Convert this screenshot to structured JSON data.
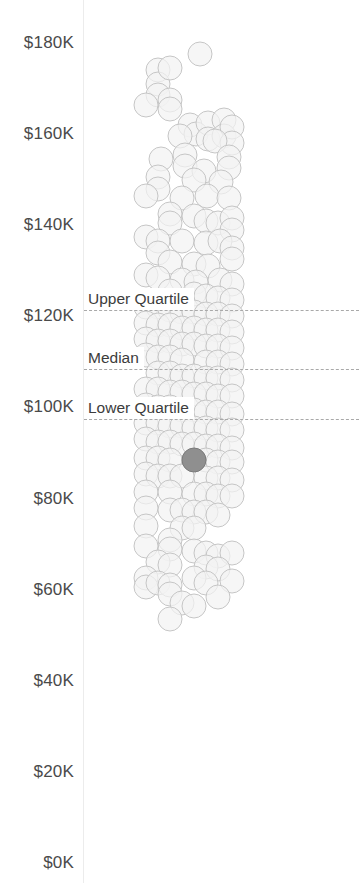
{
  "chart_data": {
    "type": "scatter",
    "title": "",
    "subtitle": "",
    "xlabel": "",
    "ylabel": "",
    "ylim": [
      0,
      190
    ],
    "grid": false,
    "legend_position": "none",
    "value_prefix": "$",
    "value_suffix": "K",
    "y_ticks": [
      {
        "label": "$180K",
        "value": 180
      },
      {
        "label": "$160K",
        "value": 160
      },
      {
        "label": "$140K",
        "value": 140
      },
      {
        "label": "$120K",
        "value": 120
      },
      {
        "label": "$100K",
        "value": 100
      },
      {
        "label": "$80K",
        "value": 80
      },
      {
        "label": "$60K",
        "value": 60
      },
      {
        "label": "$40K",
        "value": 40
      },
      {
        "label": "$20K",
        "value": 20
      },
      {
        "label": "$0K",
        "value": 0
      }
    ],
    "reference_lines": [
      {
        "name": "upper-quartile",
        "label": "Upper Quartile",
        "value": 121.5
      },
      {
        "name": "median",
        "label": "Median",
        "value": 108.5
      },
      {
        "name": "lower-quartile",
        "label": "Lower Quartile",
        "value": 97.5
      }
    ],
    "marker": {
      "shape": "circle",
      "diameter_px": 25,
      "fill": "#f3f3f3",
      "stroke": "#c6c6c6",
      "highlight_fill": "#8f8f8f",
      "highlight_stroke": "#7a7a7a"
    },
    "series": [
      {
        "name": "salaries",
        "points": [
          {
            "x": 116,
            "y": 177.5
          },
          {
            "x": 74,
            "y": 174.0
          },
          {
            "x": 74,
            "y": 171.0
          },
          {
            "x": 74,
            "y": 168.5
          },
          {
            "x": 86,
            "y": 174.5
          },
          {
            "x": 86,
            "y": 167.5
          },
          {
            "x": 86,
            "y": 165.5
          },
          {
            "x": 62,
            "y": 166.5
          },
          {
            "x": 106,
            "y": 162.0
          },
          {
            "x": 112,
            "y": 160.0
          },
          {
            "x": 96,
            "y": 159.5
          },
          {
            "x": 124,
            "y": 162.5
          },
          {
            "x": 124,
            "y": 159.0
          },
          {
            "x": 140,
            "y": 163.0
          },
          {
            "x": 140,
            "y": 159.5
          },
          {
            "x": 148,
            "y": 161.5
          },
          {
            "x": 148,
            "y": 158.0
          },
          {
            "x": 131,
            "y": 158.5
          },
          {
            "x": 77,
            "y": 154.5
          },
          {
            "x": 101,
            "y": 155.5
          },
          {
            "x": 101,
            "y": 153.0
          },
          {
            "x": 120,
            "y": 152.0
          },
          {
            "x": 145,
            "y": 155.0
          },
          {
            "x": 145,
            "y": 152.5
          },
          {
            "x": 74,
            "y": 150.5
          },
          {
            "x": 74,
            "y": 148.0
          },
          {
            "x": 110,
            "y": 150.0
          },
          {
            "x": 137,
            "y": 149.5
          },
          {
            "x": 62,
            "y": 146.5
          },
          {
            "x": 98,
            "y": 146.0
          },
          {
            "x": 123,
            "y": 146.5
          },
          {
            "x": 145,
            "y": 146.0
          },
          {
            "x": 86,
            "y": 142.5
          },
          {
            "x": 86,
            "y": 140.5
          },
          {
            "x": 110,
            "y": 142.0
          },
          {
            "x": 122,
            "y": 141.0
          },
          {
            "x": 134,
            "y": 140.5
          },
          {
            "x": 148,
            "y": 141.5
          },
          {
            "x": 148,
            "y": 139.0
          },
          {
            "x": 62,
            "y": 137.5
          },
          {
            "x": 74,
            "y": 136.5
          },
          {
            "x": 74,
            "y": 134.0
          },
          {
            "x": 98,
            "y": 136.5
          },
          {
            "x": 122,
            "y": 136.0
          },
          {
            "x": 136,
            "y": 136.5
          },
          {
            "x": 148,
            "y": 135.0
          },
          {
            "x": 148,
            "y": 132.5
          },
          {
            "x": 86,
            "y": 132.0
          },
          {
            "x": 110,
            "y": 131.5
          },
          {
            "x": 124,
            "y": 131.0
          },
          {
            "x": 62,
            "y": 129.0
          },
          {
            "x": 74,
            "y": 128.5
          },
          {
            "x": 98,
            "y": 128.0
          },
          {
            "x": 112,
            "y": 127.5
          },
          {
            "x": 136,
            "y": 128.0
          },
          {
            "x": 148,
            "y": 127.0
          },
          {
            "x": 86,
            "y": 125.5
          },
          {
            "x": 110,
            "y": 125.0
          },
          {
            "x": 122,
            "y": 124.5
          },
          {
            "x": 134,
            "y": 124.0
          },
          {
            "x": 148,
            "y": 123.5
          },
          {
            "x": 62,
            "y": 122.0
          },
          {
            "x": 74,
            "y": 122.0
          },
          {
            "x": 86,
            "y": 121.5
          },
          {
            "x": 98,
            "y": 121.0
          },
          {
            "x": 110,
            "y": 121.0
          },
          {
            "x": 122,
            "y": 120.5
          },
          {
            "x": 134,
            "y": 120.5
          },
          {
            "x": 148,
            "y": 120.0
          },
          {
            "x": 62,
            "y": 118.5
          },
          {
            "x": 74,
            "y": 118.0
          },
          {
            "x": 86,
            "y": 118.0
          },
          {
            "x": 98,
            "y": 117.5
          },
          {
            "x": 110,
            "y": 117.5
          },
          {
            "x": 122,
            "y": 117.0
          },
          {
            "x": 134,
            "y": 117.0
          },
          {
            "x": 148,
            "y": 116.5
          },
          {
            "x": 62,
            "y": 115.0
          },
          {
            "x": 74,
            "y": 114.5
          },
          {
            "x": 86,
            "y": 114.5
          },
          {
            "x": 98,
            "y": 114.0
          },
          {
            "x": 110,
            "y": 114.0
          },
          {
            "x": 122,
            "y": 113.5
          },
          {
            "x": 134,
            "y": 113.5
          },
          {
            "x": 148,
            "y": 113.0
          },
          {
            "x": 62,
            "y": 111.5
          },
          {
            "x": 74,
            "y": 111.0
          },
          {
            "x": 86,
            "y": 111.0
          },
          {
            "x": 98,
            "y": 110.5
          },
          {
            "x": 122,
            "y": 110.0
          },
          {
            "x": 134,
            "y": 110.0
          },
          {
            "x": 148,
            "y": 109.5
          },
          {
            "x": 74,
            "y": 107.5
          },
          {
            "x": 86,
            "y": 107.5
          },
          {
            "x": 98,
            "y": 107.0
          },
          {
            "x": 110,
            "y": 107.0
          },
          {
            "x": 122,
            "y": 106.5
          },
          {
            "x": 134,
            "y": 106.5
          },
          {
            "x": 148,
            "y": 106.0
          },
          {
            "x": 62,
            "y": 104.0
          },
          {
            "x": 74,
            "y": 104.0
          },
          {
            "x": 86,
            "y": 103.5
          },
          {
            "x": 98,
            "y": 103.5
          },
          {
            "x": 110,
            "y": 103.0
          },
          {
            "x": 122,
            "y": 103.0
          },
          {
            "x": 134,
            "y": 102.5
          },
          {
            "x": 148,
            "y": 102.5
          },
          {
            "x": 62,
            "y": 100.5
          },
          {
            "x": 74,
            "y": 100.0
          },
          {
            "x": 86,
            "y": 100.0
          },
          {
            "x": 98,
            "y": 99.5
          },
          {
            "x": 110,
            "y": 99.5
          },
          {
            "x": 122,
            "y": 99.0
          },
          {
            "x": 134,
            "y": 99.0
          },
          {
            "x": 148,
            "y": 98.5
          },
          {
            "x": 62,
            "y": 96.5
          },
          {
            "x": 74,
            "y": 96.5
          },
          {
            "x": 86,
            "y": 96.0
          },
          {
            "x": 98,
            "y": 96.0
          },
          {
            "x": 110,
            "y": 95.5
          },
          {
            "x": 122,
            "y": 95.5
          },
          {
            "x": 134,
            "y": 95.0
          },
          {
            "x": 148,
            "y": 95.0
          },
          {
            "x": 62,
            "y": 93.0
          },
          {
            "x": 74,
            "y": 92.5
          },
          {
            "x": 86,
            "y": 92.5
          },
          {
            "x": 98,
            "y": 92.0
          },
          {
            "x": 110,
            "y": 92.0
          },
          {
            "x": 122,
            "y": 91.5
          },
          {
            "x": 134,
            "y": 91.5
          },
          {
            "x": 148,
            "y": 91.0
          },
          {
            "x": 62,
            "y": 89.0
          },
          {
            "x": 74,
            "y": 89.0
          },
          {
            "x": 86,
            "y": 88.5
          },
          {
            "x": 122,
            "y": 88.5
          },
          {
            "x": 134,
            "y": 88.0
          },
          {
            "x": 148,
            "y": 88.0
          },
          {
            "x": 110,
            "y": 88.5,
            "highlight": true
          },
          {
            "x": 62,
            "y": 85.5
          },
          {
            "x": 74,
            "y": 85.0
          },
          {
            "x": 86,
            "y": 85.0
          },
          {
            "x": 98,
            "y": 85.0
          },
          {
            "x": 122,
            "y": 84.5
          },
          {
            "x": 134,
            "y": 84.5
          },
          {
            "x": 148,
            "y": 84.0
          },
          {
            "x": 62,
            "y": 81.5
          },
          {
            "x": 86,
            "y": 81.5
          },
          {
            "x": 110,
            "y": 81.0
          },
          {
            "x": 122,
            "y": 81.0
          },
          {
            "x": 134,
            "y": 80.5
          },
          {
            "x": 148,
            "y": 80.5
          },
          {
            "x": 62,
            "y": 78.0
          },
          {
            "x": 86,
            "y": 77.5
          },
          {
            "x": 98,
            "y": 77.5
          },
          {
            "x": 110,
            "y": 77.0
          },
          {
            "x": 122,
            "y": 77.0
          },
          {
            "x": 134,
            "y": 76.5
          },
          {
            "x": 62,
            "y": 74.0
          },
          {
            "x": 98,
            "y": 73.5
          },
          {
            "x": 110,
            "y": 73.5
          },
          {
            "x": 86,
            "y": 71.0
          },
          {
            "x": 86,
            "y": 69.0
          },
          {
            "x": 62,
            "y": 69.5
          },
          {
            "x": 110,
            "y": 68.5
          },
          {
            "x": 122,
            "y": 68.0
          },
          {
            "x": 134,
            "y": 67.5
          },
          {
            "x": 148,
            "y": 68.0
          },
          {
            "x": 74,
            "y": 66.0
          },
          {
            "x": 86,
            "y": 65.5
          },
          {
            "x": 122,
            "y": 65.0
          },
          {
            "x": 134,
            "y": 64.5
          },
          {
            "x": 62,
            "y": 62.5
          },
          {
            "x": 62,
            "y": 60.5
          },
          {
            "x": 74,
            "y": 61.5
          },
          {
            "x": 86,
            "y": 61.0
          },
          {
            "x": 86,
            "y": 59.0
          },
          {
            "x": 110,
            "y": 62.5
          },
          {
            "x": 122,
            "y": 61.5
          },
          {
            "x": 148,
            "y": 62.0
          },
          {
            "x": 134,
            "y": 58.5
          },
          {
            "x": 98,
            "y": 57.0
          },
          {
            "x": 110,
            "y": 56.5
          },
          {
            "x": 86,
            "y": 53.5
          }
        ]
      }
    ]
  }
}
